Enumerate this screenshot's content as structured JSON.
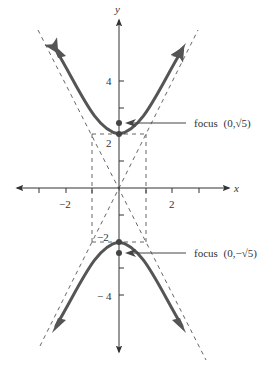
{
  "diagram": {
    "axes": {
      "x_label": "x",
      "y_label": "y",
      "x_ticks": [
        -3,
        -2,
        -1,
        1,
        2,
        3
      ],
      "x_tick_labels": [
        {
          "value": -2,
          "text": "−2"
        },
        {
          "value": 2,
          "text": "2"
        }
      ],
      "y_ticks": [
        -5,
        -4,
        -3,
        -2,
        -1,
        1,
        2,
        3,
        4,
        5
      ],
      "y_tick_labels": [
        {
          "value": 4,
          "text": "4"
        },
        {
          "value": 2,
          "text": "2"
        },
        {
          "value": -2,
          "text": "−2"
        },
        {
          "value": -4,
          "text": "− 4"
        }
      ]
    },
    "equation": {
      "a": 2,
      "b": 1,
      "c_squared": 5
    },
    "asymptotes": [
      "y = 2x",
      "y = -2x"
    ],
    "fundamental_rectangle": {
      "x_min": -1,
      "x_max": 1,
      "y_min": -2,
      "y_max": 2
    },
    "vertices": [
      {
        "x": 0,
        "y": 2
      },
      {
        "x": 0,
        "y": -2
      }
    ],
    "foci": [
      {
        "x": 0,
        "y": 2.236,
        "label": "focus",
        "coords": "(0,√5)"
      },
      {
        "x": 0,
        "y": -2.236,
        "label": "focus",
        "coords": "(0,−√5)"
      }
    ],
    "colors": {
      "curve": "#555555",
      "axis": "#333333",
      "dashed": "#444444",
      "text": "#333333"
    }
  }
}
